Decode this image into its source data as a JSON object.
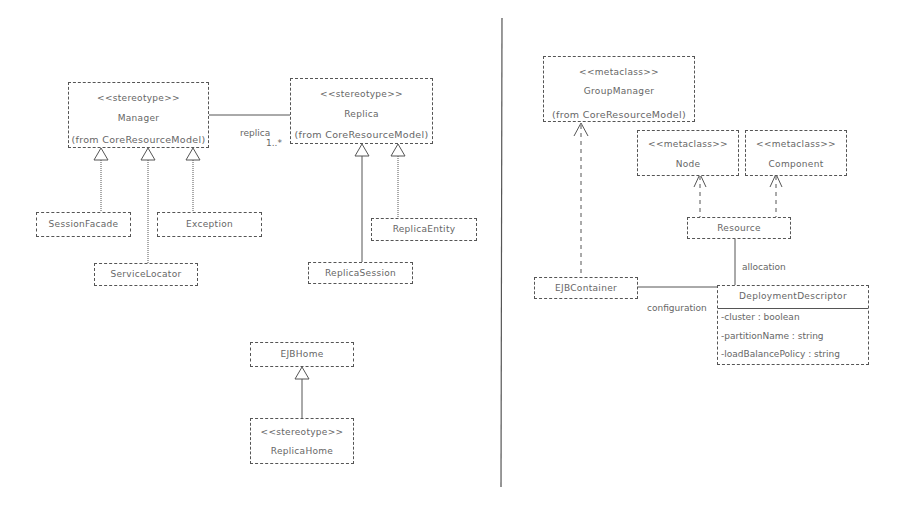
{
  "left_panel": {
    "manager": {
      "stereotype": "<<stereotype>>",
      "name": "Manager",
      "from": "(from CoreResourceModel)"
    },
    "replica": {
      "stereotype": "<<stereotype>>",
      "name": "Replica",
      "from": "(from CoreResourceModel)"
    },
    "association": {
      "role": "replica",
      "multiplicity": "1..*"
    },
    "session_facade": {
      "name": "SessionFacade"
    },
    "exception": {
      "name": "Exception"
    },
    "service_locator": {
      "name": "ServiceLocator"
    },
    "replica_entity": {
      "name": "ReplicaEntity"
    },
    "replica_session": {
      "name": "ReplicaSession"
    },
    "ejb_home": {
      "name": "EJBHome"
    },
    "replica_home": {
      "stereotype": "<<stereotype>>",
      "name": "ReplicaHome"
    }
  },
  "right_panel": {
    "group_manager": {
      "stereotype": "<<metaclass>>",
      "name": "GroupManager",
      "from": "(from CoreResourceModel)"
    },
    "node": {
      "stereotype": "<<metaclass>>",
      "name": "Node"
    },
    "component": {
      "stereotype": "<<metaclass>>",
      "name": "Component"
    },
    "resource": {
      "name": "Resource"
    },
    "allocation_label": "allocation",
    "ejb_container": {
      "name": "EJBContainer"
    },
    "configuration_label": "configuration",
    "deployment_descriptor": {
      "name": "DeploymentDescriptor",
      "attributes": [
        "-cluster : boolean",
        "-partitionName : string",
        "-loadBalancePolicy : string"
      ]
    }
  }
}
